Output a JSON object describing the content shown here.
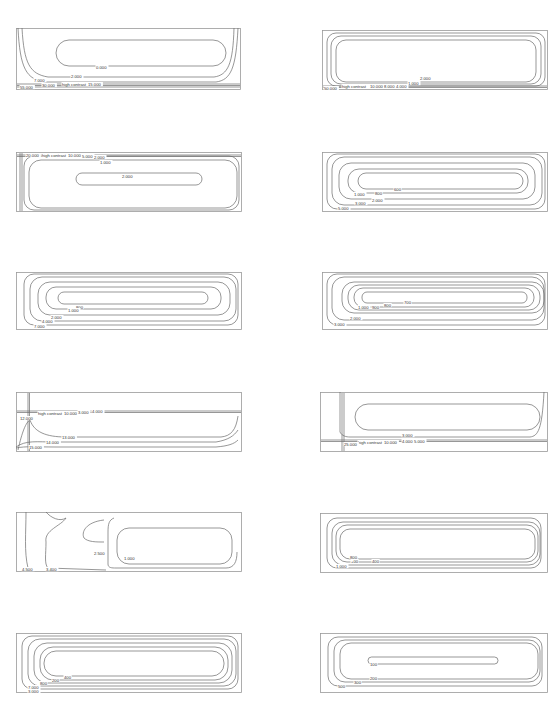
{
  "panels": [
    {
      "id": "p1",
      "x": 16,
      "y": 28,
      "w": 225,
      "h": 62,
      "contours": [
        {
          "type": "rect",
          "x": 40,
          "y": 12,
          "w": 170,
          "h": 26,
          "r": 13
        },
        {
          "type": "edge",
          "d": "M2,0 C4,40 10,52 30,54 L200,54 C215,52 220,40 222,0"
        },
        {
          "type": "edge",
          "d": "M6,0 C8,36 14,46 32,49 L198,49 C212,47 217,36 218,0"
        },
        {
          "type": "hline",
          "y": 56
        },
        {
          "type": "hline",
          "y": 57.5
        },
        {
          "type": "hline",
          "y": 59
        }
      ],
      "labels": [
        {
          "t": "0.000",
          "x": 80,
          "y": 39
        },
        {
          "t": "2.000",
          "x": 55,
          "y": 48
        },
        {
          "t": "7.000",
          "x": 18,
          "y": 52
        },
        {
          "t": "30.000",
          "x": 26,
          "y": 57
        },
        {
          "t": "high contrast",
          "x": 46,
          "y": 56
        },
        {
          "t": "15.000",
          "x": 72,
          "y": 56
        },
        {
          "t": "55.000",
          "x": 4,
          "y": 59
        }
      ]
    },
    {
      "id": "p2",
      "x": 322,
      "y": 30,
      "w": 226,
      "h": 60,
      "contours": [
        {
          "type": "rect",
          "x": 14,
          "y": 10,
          "w": 200,
          "h": 42,
          "r": 10
        },
        {
          "type": "rect",
          "x": 9,
          "y": 6,
          "w": 210,
          "h": 48,
          "r": 10
        },
        {
          "type": "rect",
          "x": 5,
          "y": 3,
          "w": 218,
          "h": 53,
          "r": 9
        },
        {
          "type": "hline",
          "y": 56
        },
        {
          "type": "hline",
          "y": 57.5
        }
      ],
      "labels": [
        {
          "t": "2.000",
          "x": 98,
          "y": 48
        },
        {
          "t": "1.000",
          "x": 86,
          "y": 53
        },
        {
          "t": "high contrast",
          "x": 20,
          "y": 56
        },
        {
          "t": "10.000",
          "x": 48,
          "y": 56
        },
        {
          "t": "8.000",
          "x": 62,
          "y": 56
        },
        {
          "t": "4.000",
          "x": 74,
          "y": 56
        },
        {
          "t": "50.000",
          "x": 2,
          "y": 58
        }
      ]
    },
    {
      "id": "p3",
      "x": 16,
      "y": 152,
      "w": 226,
      "h": 60,
      "contours": [
        {
          "type": "rect",
          "x": 60,
          "y": 21,
          "w": 126,
          "h": 12,
          "r": 6
        },
        {
          "type": "rect",
          "x": 13,
          "y": 8,
          "w": 208,
          "h": 48,
          "r": 12
        },
        {
          "type": "rect",
          "x": 8,
          "y": 4,
          "w": 215,
          "h": 54,
          "r": 10
        },
        {
          "type": "vline",
          "x": 4
        },
        {
          "type": "vline",
          "x": 6
        },
        {
          "type": "hline",
          "y": 3
        },
        {
          "type": "hline",
          "y": 4.5
        }
      ],
      "labels": [
        {
          "t": "20.000",
          "x": 10,
          "y": 3
        },
        {
          "t": "high contrast",
          "x": 26,
          "y": 3
        },
        {
          "t": "10.000",
          "x": 52,
          "y": 3
        },
        {
          "t": "5.000",
          "x": 66,
          "y": 4
        },
        {
          "t": "2.000",
          "x": 78,
          "y": 5
        },
        {
          "t": "1.000",
          "x": 84,
          "y": 10
        },
        {
          "t": "2.000",
          "x": 106,
          "y": 24
        }
      ]
    },
    {
      "id": "p4",
      "x": 322,
      "y": 152,
      "w": 226,
      "h": 60,
      "contours": [
        {
          "type": "rect",
          "x": 36,
          "y": 21,
          "w": 165,
          "h": 16,
          "r": 8
        },
        {
          "type": "rect",
          "x": 26,
          "y": 17,
          "w": 180,
          "h": 24,
          "r": 11
        },
        {
          "type": "rect",
          "x": 17,
          "y": 11,
          "w": 196,
          "h": 36,
          "r": 12
        },
        {
          "type": "rect",
          "x": 10,
          "y": 5,
          "w": 210,
          "h": 48,
          "r": 12
        },
        {
          "type": "rect",
          "x": 5,
          "y": 2,
          "w": 218,
          "h": 55,
          "r": 10
        }
      ],
      "labels": [
        {
          "t": "600",
          "x": 72,
          "y": 37
        },
        {
          "t": "800",
          "x": 53,
          "y": 41
        },
        {
          "t": "1.000",
          "x": 32,
          "y": 42
        },
        {
          "t": "2.000",
          "x": 50,
          "y": 48
        },
        {
          "t": "3.000",
          "x": 33,
          "y": 51
        },
        {
          "t": "5.000",
          "x": 16,
          "y": 56
        }
      ]
    },
    {
      "id": "p5",
      "x": 16,
      "y": 272,
      "w": 226,
      "h": 58,
      "contours": [
        {
          "type": "rect",
          "x": 42,
          "y": 20,
          "w": 150,
          "h": 12,
          "r": 6
        },
        {
          "type": "rect",
          "x": 30,
          "y": 15,
          "w": 175,
          "h": 22,
          "r": 10
        },
        {
          "type": "rect",
          "x": 22,
          "y": 10,
          "w": 192,
          "h": 33,
          "r": 12
        },
        {
          "type": "rect",
          "x": 14,
          "y": 5,
          "w": 206,
          "h": 44,
          "r": 12
        },
        {
          "type": "rect",
          "x": 8,
          "y": 2,
          "w": 214,
          "h": 51,
          "r": 10
        }
      ],
      "labels": [
        {
          "t": "800",
          "x": 60,
          "y": 35
        },
        {
          "t": "1.000",
          "x": 52,
          "y": 38
        },
        {
          "t": "2.000",
          "x": 35,
          "y": 45
        },
        {
          "t": "4.000",
          "x": 26,
          "y": 49
        },
        {
          "t": "7.000",
          "x": 18,
          "y": 54
        }
      ]
    },
    {
      "id": "p6",
      "x": 322,
      "y": 272,
      "w": 226,
      "h": 58,
      "contours": [
        {
          "type": "rect",
          "x": 40,
          "y": 20,
          "w": 165,
          "h": 11,
          "r": 5
        },
        {
          "type": "rect",
          "x": 32,
          "y": 16,
          "w": 180,
          "h": 19,
          "r": 9
        },
        {
          "type": "rect",
          "x": 26,
          "y": 13,
          "w": 192,
          "h": 25,
          "r": 11
        },
        {
          "type": "rect",
          "x": 20,
          "y": 10,
          "w": 202,
          "h": 31,
          "r": 12
        },
        {
          "type": "rect",
          "x": 10,
          "y": 5,
          "w": 212,
          "h": 43,
          "r": 12
        },
        {
          "type": "rect",
          "x": 5,
          "y": 2,
          "w": 218,
          "h": 51,
          "r": 10
        }
      ],
      "labels": [
        {
          "t": "700",
          "x": 82,
          "y": 30
        },
        {
          "t": "800",
          "x": 62,
          "y": 33
        },
        {
          "t": "900",
          "x": 50,
          "y": 35
        },
        {
          "t": "1.000",
          "x": 36,
          "y": 35
        },
        {
          "t": "2.000",
          "x": 28,
          "y": 46
        },
        {
          "t": "3.000",
          "x": 12,
          "y": 52
        }
      ]
    },
    {
      "id": "p7",
      "x": 16,
      "y": 392,
      "w": 226,
      "h": 60,
      "contours": [
        {
          "type": "vline",
          "x": 12
        },
        {
          "type": "vline",
          "x": 13.5
        },
        {
          "type": "hline",
          "y": 19
        },
        {
          "type": "hline",
          "y": 20.5
        },
        {
          "type": "edge",
          "d": "M2,58 C6,40 10,30 14,28 C18,40 30,45 50,45 L205,45 C215,44 220,38 222,24"
        },
        {
          "type": "edge",
          "d": "M0,55 C10,48 20,50 40,50 L200,50 C212,48 218,44 222,38"
        },
        {
          "type": "edge",
          "d": "M0,56 C10,54 20,55 40,55 L200,55 C212,54 218,52 222,48"
        }
      ],
      "labels": [
        {
          "t": "high contrast",
          "x": 22,
          "y": 21
        },
        {
          "t": "10.000",
          "x": 48,
          "y": 21
        },
        {
          "t": "3.000",
          "x": 62,
          "y": 20
        },
        {
          "t": "4.000",
          "x": 76,
          "y": 19
        },
        {
          "t": "12.000",
          "x": 4,
          "y": 26
        },
        {
          "t": "13.000",
          "x": 46,
          "y": 45
        },
        {
          "t": "14.000",
          "x": 30,
          "y": 50
        },
        {
          "t": "15.000",
          "x": 13,
          "y": 55
        }
      ]
    },
    {
      "id": "p8",
      "x": 320,
      "y": 392,
      "w": 228,
      "h": 60,
      "contours": [
        {
          "type": "rect",
          "x": 35,
          "y": 12,
          "w": 185,
          "h": 26,
          "r": 13
        },
        {
          "type": "edge",
          "d": "M20,0 L20,40 C22,44 26,45 30,45 L210,45 C218,44 222,38 224,0"
        },
        {
          "type": "vline",
          "x": 22
        },
        {
          "type": "vline",
          "x": 24
        },
        {
          "type": "hline",
          "y": 48
        },
        {
          "type": "hline",
          "y": 49.5
        }
      ],
      "labels": [
        {
          "t": "3.000",
          "x": 82,
          "y": 43
        },
        {
          "t": "4.000",
          "x": 82,
          "y": 49
        },
        {
          "t": "5.000",
          "x": 94,
          "y": 49
        },
        {
          "t": "high contrast",
          "x": 38,
          "y": 50
        },
        {
          "t": "10.000",
          "x": 64,
          "y": 50
        },
        {
          "t": "25.000",
          "x": 24,
          "y": 52
        }
      ]
    },
    {
      "id": "p9",
      "x": 16,
      "y": 512,
      "w": 226,
      "h": 60,
      "contours": [
        {
          "type": "edge",
          "d": "M98,6 C93,8 92,12 92,20 L92,52 C92,56 96,56 100,56 L210,56 C218,56 221,50 221,40"
        },
        {
          "type": "rect",
          "x": 101,
          "y": 16,
          "w": 115,
          "h": 36,
          "r": 12
        },
        {
          "type": "edge",
          "d": "M30,0 C35,6 44,10 50,6 C45,14 28,18 30,30 C30,42 28,52 32,56 L90,58"
        },
        {
          "type": "edge",
          "d": "M10,0 C10,20 8,40 12,56"
        },
        {
          "type": "edge",
          "d": "M88,8 C70,10 65,20 68,26 C72,30 80,30 88,30"
        }
      ],
      "labels": [
        {
          "t": "2.500",
          "x": 78,
          "y": 41
        },
        {
          "t": "1.000",
          "x": 108,
          "y": 46
        },
        {
          "t": "4.500",
          "x": 6,
          "y": 57
        },
        {
          "t": "3.400",
          "x": 30,
          "y": 57
        }
      ]
    },
    {
      "id": "p10",
      "x": 320,
      "y": 513,
      "w": 228,
      "h": 60,
      "contours": [
        {
          "type": "rect",
          "x": 20,
          "y": 16,
          "w": 195,
          "h": 30,
          "r": 10
        },
        {
          "type": "rect",
          "x": 16,
          "y": 12,
          "w": 202,
          "h": 37,
          "r": 11
        },
        {
          "type": "rect",
          "x": 12,
          "y": 9,
          "w": 208,
          "h": 43,
          "r": 11
        },
        {
          "type": "rect",
          "x": 7,
          "y": 5,
          "w": 214,
          "h": 50,
          "r": 10
        }
      ],
      "labels": [
        {
          "t": "800",
          "x": 30,
          "y": 44
        },
        {
          "t": "400",
          "x": 52,
          "y": 48
        },
        {
          "t": "+00",
          "x": 31,
          "y": 48
        },
        {
          "t": "1.000",
          "x": 16,
          "y": 53
        }
      ]
    },
    {
      "id": "p11",
      "x": 16,
      "y": 633,
      "w": 226,
      "h": 60,
      "contours": [
        {
          "type": "rect",
          "x": 28,
          "y": 18,
          "w": 180,
          "h": 25,
          "r": 12
        },
        {
          "type": "rect",
          "x": 24,
          "y": 14,
          "w": 188,
          "h": 33,
          "r": 13
        },
        {
          "type": "rect",
          "x": 18,
          "y": 10,
          "w": 198,
          "h": 40,
          "r": 13
        },
        {
          "type": "rect",
          "x": 12,
          "y": 6,
          "w": 208,
          "h": 47,
          "r": 12
        },
        {
          "type": "rect",
          "x": 6,
          "y": 3,
          "w": 216,
          "h": 53,
          "r": 10
        }
      ],
      "labels": [
        {
          "t": "400",
          "x": 48,
          "y": 44
        },
        {
          "t": "200",
          "x": 36,
          "y": 47
        },
        {
          "t": "800",
          "x": 24,
          "y": 50
        },
        {
          "t": "7.000",
          "x": 12,
          "y": 54
        },
        {
          "t": "3.000",
          "x": 12,
          "y": 58
        }
      ]
    },
    {
      "id": "p12",
      "x": 320,
      "y": 633,
      "w": 228,
      "h": 60,
      "contours": [
        {
          "type": "rect",
          "x": 48,
          "y": 24,
          "w": 130,
          "h": 7,
          "r": 3.5
        },
        {
          "type": "rect",
          "x": 20,
          "y": 10,
          "w": 198,
          "h": 36,
          "r": 11
        },
        {
          "type": "rect",
          "x": 14,
          "y": 7,
          "w": 206,
          "h": 42,
          "r": 11
        },
        {
          "type": "rect",
          "x": 8,
          "y": 4,
          "w": 214,
          "h": 49,
          "r": 10
        }
      ],
      "labels": [
        {
          "t": "100",
          "x": 50,
          "y": 31
        },
        {
          "t": "200",
          "x": 50,
          "y": 45
        },
        {
          "t": "300",
          "x": 34,
          "y": 49
        },
        {
          "t": "500",
          "x": 18,
          "y": 53
        }
      ]
    }
  ]
}
